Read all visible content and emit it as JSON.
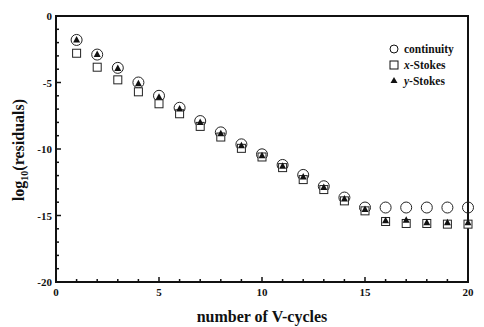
{
  "chart_data": {
    "type": "scatter",
    "title": "",
    "xlabel": "number of V-cycles",
    "ylabel": "log10(residuals)",
    "ylabel_parts": {
      "main": "log",
      "sub": "10",
      "rest": "(residuals)"
    },
    "xlim": [
      0,
      20
    ],
    "ylim": [
      -20,
      0
    ],
    "xticks": [
      0,
      5,
      10,
      15,
      20
    ],
    "yticks": [
      0,
      -5,
      -10,
      -15,
      -20
    ],
    "x_minor_step": 1,
    "y_minor_step": 1,
    "grid": false,
    "legend_position": "upper right",
    "x": [
      1,
      2,
      3,
      4,
      5,
      6,
      7,
      8,
      9,
      10,
      11,
      12,
      13,
      14,
      15,
      16,
      17,
      18,
      19,
      20
    ],
    "series": [
      {
        "name": "continuity",
        "marker": "open-circle",
        "values": [
          -1.8,
          -2.9,
          -3.9,
          -5.0,
          -6.0,
          -6.9,
          -7.9,
          -8.75,
          -9.65,
          -10.4,
          -11.2,
          -11.95,
          -12.8,
          -13.65,
          -14.4,
          -14.4,
          -14.4,
          -14.4,
          -14.4,
          -14.4
        ]
      },
      {
        "name": "x-Stokes",
        "marker": "open-square",
        "values": [
          -2.8,
          -3.85,
          -4.8,
          -5.7,
          -6.6,
          -7.35,
          -8.3,
          -9.1,
          -9.95,
          -10.6,
          -11.4,
          -12.3,
          -13.05,
          -13.9,
          -14.65,
          -15.45,
          -15.6,
          -15.6,
          -15.65,
          -15.65
        ]
      },
      {
        "name": "y-Stokes",
        "marker": "filled-triangle",
        "values": [
          -1.8,
          -2.9,
          -3.95,
          -5.1,
          -6.1,
          -7.0,
          -8.0,
          -8.85,
          -9.75,
          -10.5,
          -11.3,
          -12.1,
          -12.9,
          -13.75,
          -14.55,
          -15.4,
          -15.35,
          -15.55,
          -15.55,
          -15.55
        ]
      }
    ]
  },
  "legend": [
    {
      "label_prefix": "",
      "label_italic": "",
      "label": "continuity",
      "marker": "open-circle"
    },
    {
      "label_italic": "x",
      "label": "-Stokes",
      "marker": "open-square"
    },
    {
      "label_italic": "y",
      "label": "-Stokes",
      "marker": "filled-triangle"
    }
  ],
  "axis": {
    "xlabel": "number of V-cycles",
    "ylabel_main": "log",
    "ylabel_sub": "10",
    "ylabel_rest": "(residuals)"
  },
  "colors": {
    "ink": "#111111",
    "background": "#ffffff"
  }
}
